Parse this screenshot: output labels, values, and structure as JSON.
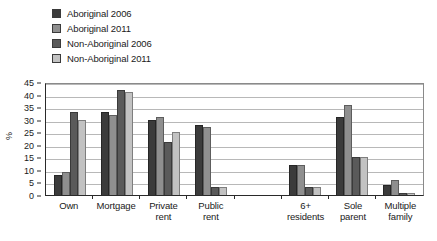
{
  "chart_data": {
    "type": "bar",
    "title": "",
    "xlabel": "",
    "ylabel": "%",
    "ylim": [
      0,
      45
    ],
    "yticks": [
      0,
      5,
      10,
      15,
      20,
      25,
      30,
      35,
      40,
      45
    ],
    "grid": true,
    "legend_position": "top-left",
    "categories": [
      "Own",
      "Mortgage",
      "Private rent",
      "Public rent",
      "",
      "6+ residents",
      "Sole parent",
      "Multiple family"
    ],
    "category_lines": [
      [
        "Own"
      ],
      [
        "Mortgage"
      ],
      [
        "Private",
        "rent"
      ],
      [
        "Public",
        "rent"
      ],
      [
        ""
      ],
      [
        "6+",
        "residents"
      ],
      [
        "Sole",
        "parent"
      ],
      [
        "Multiple",
        "family"
      ]
    ],
    "series": [
      {
        "name": "Aboriginal 2006",
        "color": "#3b3b3b",
        "values": [
          8,
          33,
          30,
          28,
          null,
          12,
          31,
          4
        ]
      },
      {
        "name": "Aboriginal 2011",
        "color": "#8f8f8f",
        "values": [
          9,
          32,
          31,
          27,
          null,
          12,
          36,
          6
        ]
      },
      {
        "name": "Non-Aboriginal 2006",
        "color": "#5a5a5a",
        "values": [
          33,
          42,
          21,
          3,
          null,
          3,
          15,
          1
        ]
      },
      {
        "name": "Non-Aboriginal 2011",
        "color": "#c2c2c2",
        "values": [
          30,
          41,
          25,
          3,
          null,
          3,
          15,
          1
        ]
      }
    ]
  },
  "legend": {
    "items": [
      {
        "label": "Aboriginal 2006",
        "color": "#3b3b3b"
      },
      {
        "label": "Aboriginal 2011",
        "color": "#8f8f8f"
      },
      {
        "label": "Non-Aboriginal 2006",
        "color": "#5a5a5a"
      },
      {
        "label": "Non-Aboriginal 2011",
        "color": "#c2c2c2"
      }
    ]
  }
}
